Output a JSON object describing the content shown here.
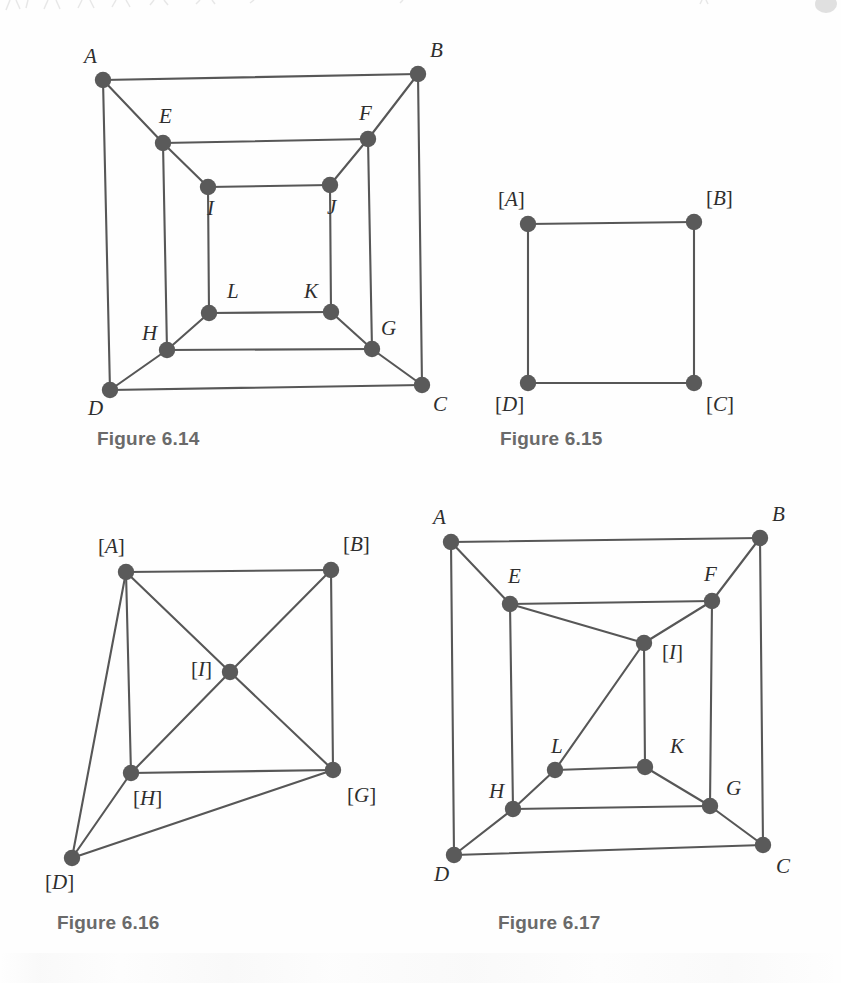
{
  "page": {
    "width": 841,
    "height": 983,
    "background": "#fefefe",
    "ink_color": "#575757",
    "node_color": "#5a5a5a",
    "label_color": "#2e2e2e",
    "caption_color": "#6a6a6a"
  },
  "figures": [
    {
      "id": "figure-6-14",
      "caption": "Figure 6.14",
      "caption_pos": {
        "x": 97,
        "y": 428
      },
      "origin": {
        "x": 0,
        "y": 0
      },
      "viewbox": {
        "w": 841,
        "h": 983
      },
      "description": "Cube-like graph with outer square A B C D, middle square E F G H and inner square I J K L, corners joined by diagonals.",
      "vertices": [
        {
          "name": "A",
          "label": "A",
          "x": 103,
          "y": 80,
          "label_x": 84,
          "label_y": 58
        },
        {
          "name": "B",
          "label": "B",
          "x": 418,
          "y": 74,
          "label_x": 430,
          "label_y": 52
        },
        {
          "name": "C",
          "label": "C",
          "x": 422,
          "y": 385,
          "label_x": 433,
          "label_y": 406
        },
        {
          "name": "D",
          "label": "D",
          "x": 110,
          "y": 390,
          "label_x": 88,
          "label_y": 410
        },
        {
          "name": "E",
          "label": "E",
          "x": 163,
          "y": 143,
          "label_x": 159,
          "label_y": 118
        },
        {
          "name": "F",
          "label": "F",
          "x": 368,
          "y": 139,
          "label_x": 359,
          "label_y": 115
        },
        {
          "name": "G",
          "label": "G",
          "x": 372,
          "y": 349,
          "label_x": 381,
          "label_y": 330
        },
        {
          "name": "H",
          "label": "H",
          "x": 167,
          "y": 350,
          "label_x": 142,
          "label_y": 335
        },
        {
          "name": "I",
          "label": "I",
          "x": 208,
          "y": 187,
          "label_x": 207,
          "label_y": 210
        },
        {
          "name": "J",
          "label": "J",
          "x": 330,
          "y": 185,
          "label_x": 327,
          "label_y": 209
        },
        {
          "name": "K",
          "label": "K",
          "x": 331,
          "y": 312,
          "label_x": 304,
          "label_y": 293
        },
        {
          "name": "L",
          "label": "L",
          "x": 209,
          "y": 313,
          "label_x": 227,
          "label_y": 293
        }
      ],
      "edges": [
        [
          "A",
          "B"
        ],
        [
          "B",
          "C"
        ],
        [
          "C",
          "D"
        ],
        [
          "D",
          "A"
        ],
        [
          "E",
          "F"
        ],
        [
          "F",
          "G"
        ],
        [
          "G",
          "H"
        ],
        [
          "H",
          "E"
        ],
        [
          "I",
          "J"
        ],
        [
          "J",
          "K"
        ],
        [
          "K",
          "L"
        ],
        [
          "L",
          "I"
        ],
        [
          "A",
          "E"
        ],
        [
          "B",
          "F"
        ],
        [
          "C",
          "G"
        ],
        [
          "D",
          "H"
        ],
        [
          "E",
          "I"
        ],
        [
          "F",
          "J"
        ],
        [
          "G",
          "K"
        ],
        [
          "H",
          "L"
        ]
      ]
    },
    {
      "id": "figure-6-15",
      "caption": "Figure 6.15",
      "caption_pos": {
        "x": 500,
        "y": 428
      },
      "description": "Quotient graph: a single square with bracketed vertices.",
      "vertices": [
        {
          "name": "A",
          "label": "[A]",
          "x": 528,
          "y": 224,
          "label_x": 498,
          "label_y": 201
        },
        {
          "name": "B",
          "label": "[B]",
          "x": 694,
          "y": 222,
          "label_x": 706,
          "label_y": 200
        },
        {
          "name": "C",
          "label": "[C]",
          "x": 694,
          "y": 383,
          "label_x": 706,
          "label_y": 406
        },
        {
          "name": "D",
          "label": "[D]",
          "x": 528,
          "y": 383,
          "label_x": 495,
          "label_y": 406
        }
      ],
      "edges": [
        [
          "A",
          "B"
        ],
        [
          "B",
          "C"
        ],
        [
          "C",
          "D"
        ],
        [
          "D",
          "A"
        ]
      ]
    },
    {
      "id": "figure-6-16",
      "caption": "Figure 6.16",
      "caption_pos": {
        "x": 57,
        "y": 912
      },
      "description": "Quotient graph with five bracketed vertices [A] [B] [D] [G] [H] and a central [I].",
      "vertices": [
        {
          "name": "A",
          "label": "[A]",
          "x": 126,
          "y": 572,
          "label_x": 98,
          "label_y": 548
        },
        {
          "name": "B",
          "label": "[B]",
          "x": 331,
          "y": 570,
          "label_x": 343,
          "label_y": 546
        },
        {
          "name": "I",
          "label": "[I]",
          "x": 230,
          "y": 672,
          "label_x": 191,
          "label_y": 671
        },
        {
          "name": "H",
          "label": "[H]",
          "x": 131,
          "y": 773,
          "label_x": 133,
          "label_y": 800
        },
        {
          "name": "G",
          "label": "[G]",
          "x": 333,
          "y": 770,
          "label_x": 347,
          "label_y": 797
        },
        {
          "name": "D",
          "label": "[D]",
          "x": 72,
          "y": 858,
          "label_x": 45,
          "label_y": 884
        }
      ],
      "edges": [
        [
          "A",
          "B"
        ],
        [
          "A",
          "I"
        ],
        [
          "A",
          "H"
        ],
        [
          "A",
          "D"
        ],
        [
          "B",
          "I"
        ],
        [
          "B",
          "G"
        ],
        [
          "I",
          "H"
        ],
        [
          "I",
          "G"
        ],
        [
          "H",
          "G"
        ],
        [
          "H",
          "D"
        ],
        [
          "D",
          "G"
        ]
      ]
    },
    {
      "id": "figure-6-17",
      "caption": "Figure 6.17",
      "caption_pos": {
        "x": 498,
        "y": 912
      },
      "description": "Cube-like graph where vertices I and J have been identified into a single vertex [I].",
      "vertices": [
        {
          "name": "A",
          "label": "A",
          "x": 451,
          "y": 542,
          "label_x": 433,
          "label_y": 519
        },
        {
          "name": "B",
          "label": "B",
          "x": 760,
          "y": 538,
          "label_x": 772,
          "label_y": 516
        },
        {
          "name": "C",
          "label": "C",
          "x": 763,
          "y": 845,
          "label_x": 776,
          "label_y": 868
        },
        {
          "name": "D",
          "label": "D",
          "x": 454,
          "y": 855,
          "label_x": 434,
          "label_y": 876
        },
        {
          "name": "E",
          "label": "E",
          "x": 510,
          "y": 604,
          "label_x": 508,
          "label_y": 578
        },
        {
          "name": "F",
          "label": "F",
          "x": 712,
          "y": 601,
          "label_x": 704,
          "label_y": 576
        },
        {
          "name": "G",
          "label": "G",
          "x": 710,
          "y": 806,
          "label_x": 726,
          "label_y": 790
        },
        {
          "name": "H",
          "label": "H",
          "x": 513,
          "y": 809,
          "label_x": 489,
          "label_y": 793
        },
        {
          "name": "I",
          "label": "[I]",
          "x": 644,
          "y": 643,
          "label_x": 662,
          "label_y": 654
        },
        {
          "name": "K",
          "label": "K",
          "x": 645,
          "y": 767,
          "label_x": 670,
          "label_y": 748
        },
        {
          "name": "L",
          "label": "L",
          "x": 555,
          "y": 770,
          "label_x": 551,
          "label_y": 748
        }
      ],
      "edges": [
        [
          "A",
          "B"
        ],
        [
          "B",
          "C"
        ],
        [
          "C",
          "D"
        ],
        [
          "D",
          "A"
        ],
        [
          "E",
          "F"
        ],
        [
          "F",
          "G"
        ],
        [
          "G",
          "H"
        ],
        [
          "H",
          "E"
        ],
        [
          "A",
          "E"
        ],
        [
          "B",
          "F"
        ],
        [
          "C",
          "G"
        ],
        [
          "D",
          "H"
        ],
        [
          "E",
          "I"
        ],
        [
          "F",
          "I"
        ],
        [
          "I",
          "K"
        ],
        [
          "I",
          "L"
        ],
        [
          "K",
          "L"
        ],
        [
          "G",
          "K"
        ],
        [
          "H",
          "L"
        ]
      ]
    }
  ]
}
